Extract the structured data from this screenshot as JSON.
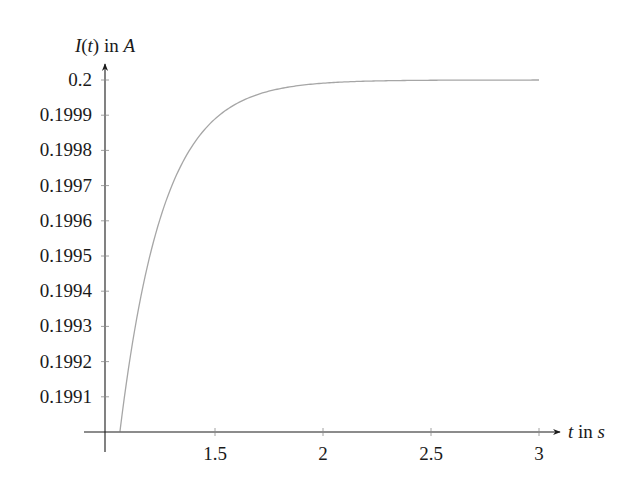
{
  "chart_data": {
    "type": "line",
    "title": "",
    "xlabel": "t in s",
    "ylabel": "I(t) in A",
    "xlabel_parts": {
      "var": "t",
      "text": " in ",
      "unit": "s"
    },
    "ylabel_parts": {
      "fn": "I",
      "open": "(",
      "var": "t",
      "close": ")",
      "text": " in ",
      "unit": "A"
    },
    "xlim": [
      1.0,
      3.0
    ],
    "ylim": [
      0.199,
      0.2
    ],
    "x_ticks": [
      1.5,
      2,
      2.5,
      3
    ],
    "x_tick_labels": [
      "1.5",
      "2",
      "2.5",
      "3"
    ],
    "y_ticks": [
      0.1991,
      0.1992,
      0.1993,
      0.1994,
      0.1995,
      0.1996,
      0.1997,
      0.1998,
      0.1999,
      0.2
    ],
    "y_tick_labels": [
      "0.1991",
      "0.1992",
      "0.1993",
      "0.1994",
      "0.1995",
      "0.1996",
      "0.1997",
      "0.1998",
      "0.1999",
      "0.2"
    ],
    "grid": false,
    "legend": null,
    "series": [
      {
        "name": "I(t)",
        "formula": "0.2*(1-exp(-5t))",
        "color": "#a6a6a6",
        "x": [
          1.06,
          1.1,
          1.15,
          1.2,
          1.25,
          1.3,
          1.4,
          1.5,
          1.6,
          1.7,
          1.8,
          1.9,
          2.0,
          2.25,
          2.5,
          2.75,
          3.0
        ],
        "values": [
          0.199002,
          0.199183,
          0.199363,
          0.199504,
          0.199614,
          0.199699,
          0.199818,
          0.199889,
          0.199933,
          0.199959,
          0.199975,
          0.199985,
          0.199991,
          0.199997,
          0.199999,
          0.2,
          0.2
        ]
      }
    ]
  },
  "colors": {
    "axis": "#1a1a1a",
    "curve": "#a6a6a6",
    "background": "#ffffff"
  }
}
